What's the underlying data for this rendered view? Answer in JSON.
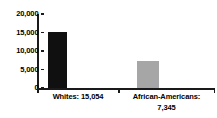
{
  "chart_data": {
    "type": "bar",
    "title": "",
    "subtitle": "",
    "xlabel": "",
    "ylabel": "",
    "categories": [
      "Whites",
      "African-Americans"
    ],
    "values": [
      15054,
      7345
    ],
    "value_labels": [
      "15,054",
      "7,345"
    ],
    "category_labels": [
      "Whites: 15,054",
      "African-Americans: 7,345"
    ],
    "series": [
      {
        "name": "",
        "values": [
          15054,
          7345
        ],
        "colors": [
          "#101010",
          "#a6a6a6"
        ]
      }
    ],
    "ylim": [
      0,
      20000
    ],
    "ytick_values": [
      20000,
      15000,
      10000,
      5000,
      0
    ],
    "ytick_labels": [
      "20,000",
      "15,000",
      "10,000",
      "5,000",
      "0"
    ],
    "grid": false,
    "legend": null,
    "legend_position": "none",
    "axis_color": "#1a1a1a",
    "background_color": "#ffffff"
  },
  "labels": {
    "cat0_line1": "Whites: 15,054",
    "cat1_line1": "African-Americans:",
    "cat1_line2": "7,345"
  },
  "yticks": {
    "t0": "20,000",
    "t1": "15,000",
    "t2": "10,000",
    "t3": "5,000",
    "t4": "0"
  }
}
